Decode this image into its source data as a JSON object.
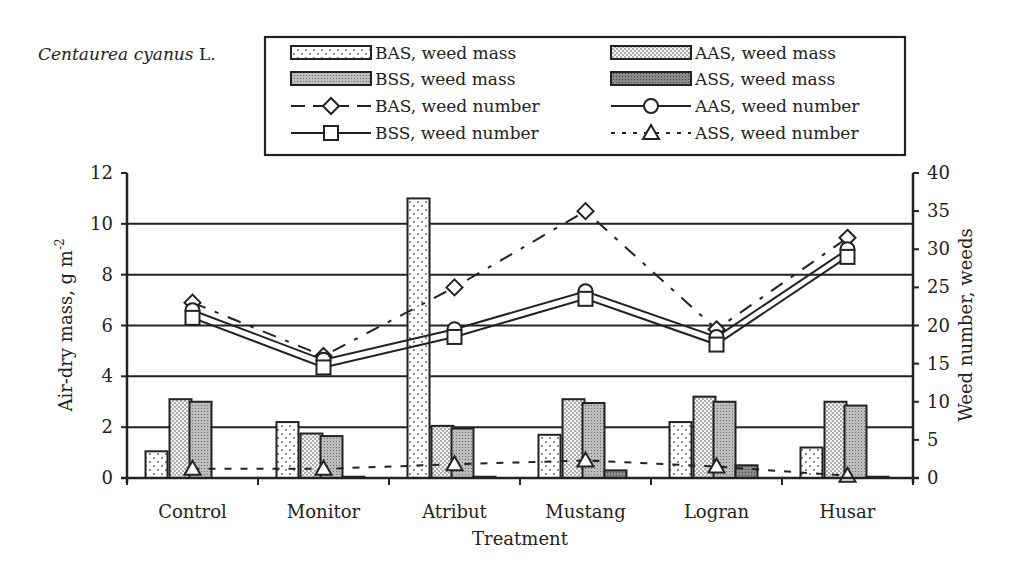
{
  "species": {
    "name": "Centaurea cyanus",
    "author": "L."
  },
  "legend": {
    "items": [
      {
        "key": "bas_mass",
        "label": "BAS, weed mass",
        "kind": "bar",
        "pattern": "sparse-dots"
      },
      {
        "key": "aas_mass",
        "label": "AAS, weed mass",
        "kind": "bar",
        "pattern": "dense-dots"
      },
      {
        "key": "bss_mass",
        "label": "BSS, weed mass",
        "kind": "bar",
        "pattern": "gray-fine"
      },
      {
        "key": "ass_mass",
        "label": "ASS, weed mass",
        "kind": "bar",
        "pattern": "dark-gray"
      },
      {
        "key": "bas_num",
        "label": "BAS, weed number",
        "kind": "line",
        "marker": "diamond",
        "dash": "long-dash"
      },
      {
        "key": "aas_num",
        "label": "AAS, weed number",
        "kind": "line",
        "marker": "circle",
        "dash": "solid"
      },
      {
        "key": "bss_num",
        "label": "BSS, weed number",
        "kind": "line",
        "marker": "square",
        "dash": "solid"
      },
      {
        "key": "ass_num",
        "label": "ASS, weed number",
        "kind": "line",
        "marker": "triangle",
        "dash": "dotted"
      }
    ]
  },
  "axes": {
    "left_title": "Air-dry mass, g m",
    "left_title_sup": "-2",
    "right_title": "Weed number, weeds",
    "x_title": "Treatment",
    "left_ticks": [
      "0",
      "2",
      "4",
      "6",
      "8",
      "10",
      "12"
    ],
    "right_ticks": [
      "0",
      "5",
      "10",
      "15",
      "20",
      "25",
      "30",
      "35",
      "40"
    ]
  },
  "chart_data": {
    "type": "bar+line",
    "title": "Centaurea cyanus L.",
    "xlabel": "Treatment",
    "ylabel": "Air-dry mass, g m-2",
    "y2label": "Weed number, weeds",
    "ylim": [
      0,
      12
    ],
    "y2lim": [
      0,
      40
    ],
    "grid": true,
    "legend_position": "top",
    "categories": [
      "Control",
      "Monitor",
      "Atribut",
      "Mustang",
      "Logran",
      "Husar"
    ],
    "series": [
      {
        "name": "BAS, weed mass",
        "type": "bar",
        "axis": "left",
        "values": [
          1.05,
          2.2,
          11.0,
          1.7,
          2.2,
          1.2
        ]
      },
      {
        "name": "AAS, weed mass",
        "type": "bar",
        "axis": "left",
        "values": [
          3.1,
          1.75,
          2.05,
          3.1,
          3.2,
          3.0
        ]
      },
      {
        "name": "BSS, weed mass",
        "type": "bar",
        "axis": "left",
        "values": [
          3.0,
          1.65,
          1.95,
          2.95,
          3.0,
          2.85
        ]
      },
      {
        "name": "ASS, weed mass",
        "type": "bar",
        "axis": "left",
        "values": [
          0.0,
          0.05,
          0.05,
          0.3,
          0.5,
          0.05
        ]
      },
      {
        "name": "BAS, weed number",
        "type": "line",
        "axis": "right",
        "values": [
          23,
          16,
          25,
          35,
          19.5,
          31.5
        ]
      },
      {
        "name": "AAS, weed number",
        "type": "line",
        "axis": "right",
        "values": [
          22,
          15.5,
          19.5,
          24.5,
          18.5,
          30
        ]
      },
      {
        "name": "BSS, weed number",
        "type": "line",
        "axis": "right",
        "values": [
          21,
          14.5,
          18.5,
          23.5,
          17.5,
          29
        ]
      },
      {
        "name": "ASS, weed number",
        "type": "line",
        "axis": "right",
        "values": [
          1.2,
          1.2,
          1.8,
          2.3,
          1.5,
          0.3
        ]
      }
    ]
  }
}
